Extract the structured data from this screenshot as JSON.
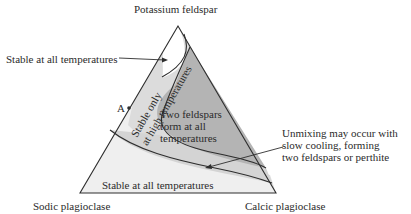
{
  "vertices": {
    "top": "Potassium feldspar",
    "bottom_left": "Sodic plagioclase",
    "bottom_right": "Calcic plagioclase"
  },
  "regions": {
    "k_stable": "Stable at all temperatures",
    "high_temp_only": [
      "Stable only",
      "at high temperatures"
    ],
    "two_feldspars": [
      "Two feldspars",
      "form at all",
      "temperatures"
    ],
    "plag_stable": "Stable at all temperatures"
  },
  "annotations": {
    "point_label": "A",
    "unmixing": [
      "Unmixing may occur with",
      "slow cooling, forming",
      "two feldspars or perthite"
    ]
  },
  "colors": {
    "outline": "#2e2e2e",
    "two_feldspar_fill": "#b4b4b4",
    "unmixing_band_fill": "#d4d4d4",
    "high_temp_band_fill": "#dcdcdc",
    "stable_fill": "#efefef"
  }
}
